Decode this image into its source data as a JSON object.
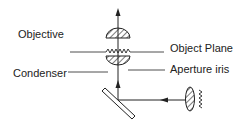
{
  "labels": {
    "objective": "Objective",
    "object_plane": "Object Plane",
    "condenser": "Condenser",
    "aperture_iris": "Aperture iris"
  },
  "colors": {
    "line": "#222222",
    "background": "#ffffff"
  }
}
